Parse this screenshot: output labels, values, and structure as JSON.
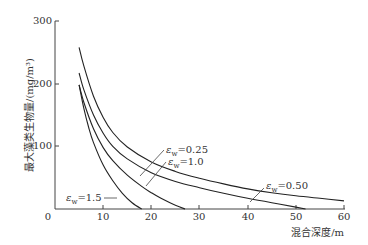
{
  "chart_data": {
    "type": "line",
    "title": "",
    "xlabel": "混合深度/m",
    "ylabel": "最大藻类生物量/(mg/m³)",
    "xlim": [
      0,
      60
    ],
    "ylim": [
      0,
      300
    ],
    "xticks": [
      0,
      10,
      20,
      30,
      40,
      50,
      60
    ],
    "yticks": [
      100,
      200,
      300
    ],
    "grid": false,
    "legend": "inline annotations",
    "series": [
      {
        "name": "εw=0.25",
        "label": "ε",
        "sub": "w",
        "value_text": "=0.25",
        "x": [
          5,
          6,
          8,
          10,
          12,
          15,
          20,
          25,
          30,
          35,
          40,
          45,
          50,
          55,
          60
        ],
        "y": [
          258,
          228,
          180,
          146,
          122,
          99,
          75,
          60,
          49,
          40,
          32,
          26,
          21,
          17,
          13
        ]
      },
      {
        "name": "εw=0.50",
        "label": "ε",
        "sub": "w",
        "value_text": "=0.50",
        "x": [
          5,
          6,
          8,
          10,
          12,
          15,
          20,
          25,
          30,
          35,
          40,
          45,
          50,
          52
        ],
        "y": [
          217,
          190,
          150,
          121,
          100,
          80,
          58,
          44,
          34,
          25,
          17,
          10,
          3,
          0
        ]
      },
      {
        "name": "εw=1.0",
        "label": "ε",
        "sub": "w",
        "value_text": "=1.0",
        "x": [
          5,
          6,
          8,
          10,
          12,
          15,
          18,
          20,
          22,
          25,
          27
        ],
        "y": [
          198,
          170,
          128,
          98,
          77,
          54,
          36,
          26,
          17,
          6,
          0
        ]
      },
      {
        "name": "εw=1.5",
        "label": "ε",
        "sub": "w",
        "value_text": "=1.5",
        "x": [
          5,
          6,
          7,
          8,
          10,
          12,
          14,
          16,
          18
        ],
        "y": [
          198,
          160,
          130,
          106,
          70,
          45,
          25,
          10,
          0
        ]
      }
    ]
  },
  "annotations": {
    "a025": {
      "eps": "ε",
      "sub": "w",
      "val": "=0.25"
    },
    "a10": {
      "eps": "ε",
      "sub": "w",
      "val": "=1.0"
    },
    "a15": {
      "eps": "ε",
      "sub": "w",
      "val": "=1.5"
    },
    "a050": {
      "eps": "ε",
      "sub": "w",
      "val": "=0.50"
    }
  },
  "axis": {
    "x_title": "混合深度/m",
    "y_title": "最大藻类生物量/(mg/m³)",
    "x_ticks": [
      "0",
      "10",
      "20",
      "30",
      "40",
      "50",
      "60"
    ],
    "y_ticks": [
      "100",
      "200",
      "300"
    ]
  }
}
